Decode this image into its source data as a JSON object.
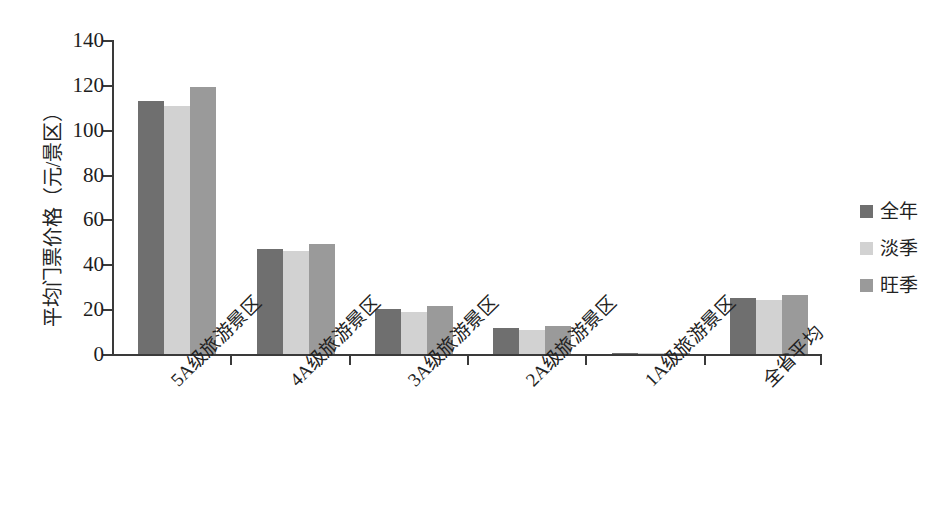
{
  "chart_data": {
    "type": "bar",
    "title": "",
    "subtitle": "",
    "xlabel": "",
    "ylabel": "平均门票价格（元/景区）",
    "ylim": [
      0,
      140
    ],
    "ytick_labels": [
      "0",
      "20",
      "40",
      "60",
      "80",
      "100",
      "120",
      "140"
    ],
    "ytick_values": [
      0,
      20,
      40,
      60,
      80,
      100,
      120,
      140
    ],
    "grid": false,
    "legend_position": "right",
    "categories": [
      "5A级旅游景区",
      "4A级旅游景区",
      "3A级旅游景区",
      "2A级旅游景区",
      "1A级旅游景区",
      "全省平均"
    ],
    "series": [
      {
        "name": "全年",
        "color": "#6f6f6f",
        "values": [
          113,
          47,
          20,
          11.5,
          0.4,
          25
        ]
      },
      {
        "name": "淡季",
        "color": "#d2d2d2",
        "values": [
          110.5,
          46,
          18.8,
          10.5,
          0.4,
          24
        ]
      },
      {
        "name": "旺季",
        "color": "#9a9a9a",
        "values": [
          119,
          49,
          21.5,
          12.5,
          0.5,
          26.5
        ]
      }
    ]
  },
  "legend": {
    "items": [
      {
        "label": "全年",
        "color": "#6f6f6f"
      },
      {
        "label": "淡季",
        "color": "#d2d2d2"
      },
      {
        "label": "旺季",
        "color": "#9a9a9a"
      }
    ]
  },
  "axes": {
    "y_title": "平均门票价格（元/景区）"
  }
}
